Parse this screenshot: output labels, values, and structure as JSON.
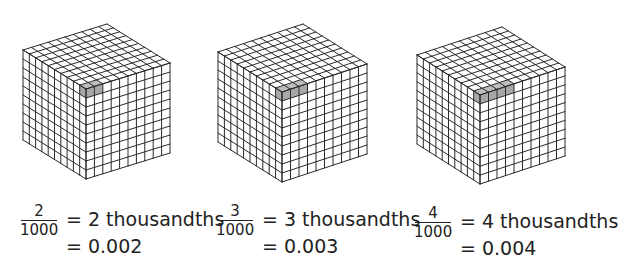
{
  "figure": {
    "panels": [
      {
        "shaded_count": 2,
        "numerator": "2",
        "denominator": "1000",
        "equation_words": "= 2 thousandths",
        "equation_decimal": "= 0.002",
        "cube": {
          "front": [
            86,
            89
          ],
          "left": [
            23,
            50
          ],
          "right": [
            170,
            63
          ],
          "height": 90
        }
      },
      {
        "shaded_count": 3,
        "numerator": "3",
        "denominator": "1000",
        "equation_words": "= 3 thousandths",
        "equation_decimal": "= 0.003",
        "cube": {
          "front": [
            282,
            92
          ],
          "left": [
            218,
            52
          ],
          "right": [
            367,
            64
          ],
          "height": 90
        }
      },
      {
        "shaded_count": 4,
        "numerator": "4",
        "denominator": "1000",
        "equation_words": "= 4 thousandths",
        "equation_decimal": "= 0.004",
        "cube": {
          "front": [
            480,
            95
          ],
          "left": [
            417,
            55
          ],
          "right": [
            565,
            67
          ],
          "height": 89
        }
      }
    ],
    "grid_divisions": 10,
    "colors": {
      "line": "#2a2a2a",
      "shade": "#bdbdbd",
      "shade_side": "#a8a8a8",
      "face": "#ffffff"
    }
  }
}
